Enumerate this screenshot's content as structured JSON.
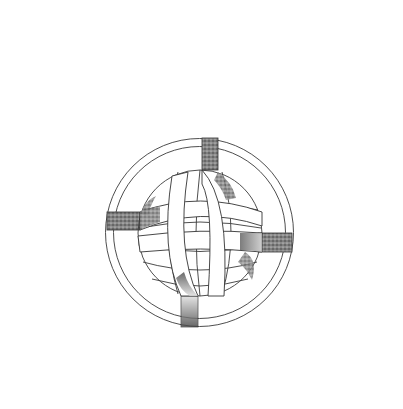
{
  "illustration": {
    "subject": "interwoven knot sphere within double ring",
    "background_color": "#ffffff",
    "line_color": "#3a3a3a",
    "shade_color": "#555555",
    "outer_ring": {
      "cx": 199.5,
      "cy": 232.5,
      "r_outer": 94,
      "r_inner": 86
    },
    "sphere": {
      "cx": 200,
      "cy": 233,
      "rx": 62,
      "ry": 63
    },
    "bands": [
      {
        "name": "top-vertical-band",
        "x1": 202,
        "x2": 218
      },
      {
        "name": "bottom-vertical-band",
        "x1": 181,
        "x2": 198
      },
      {
        "name": "left-horizontal-band",
        "y1": 212,
        "y2": 230
      },
      {
        "name": "right-horizontal-band",
        "y1": 233,
        "y2": 252
      }
    ]
  }
}
